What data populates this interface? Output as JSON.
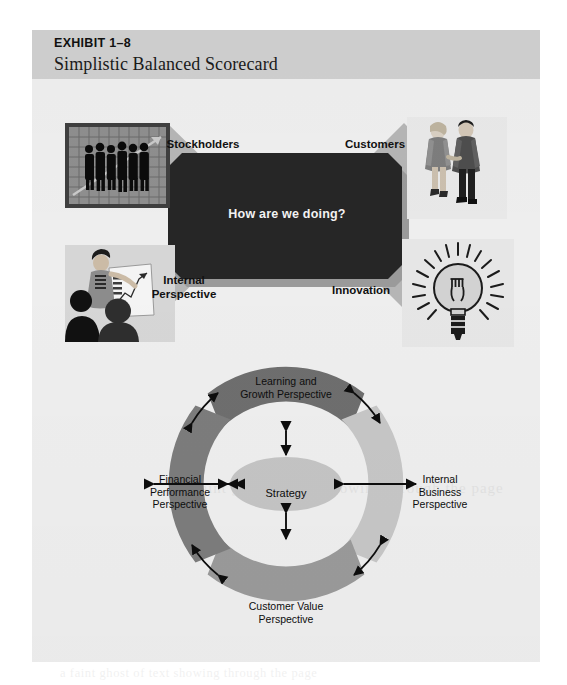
{
  "exhibit": {
    "number": "EXHIBIT 1–8",
    "title": "Simplistic Balanced Scorecard"
  },
  "top_diagram": {
    "center_text": "How are we doing?",
    "labels": {
      "stockholders": "Stockholders",
      "customers": "Customers",
      "internal": "Internal\nPerspective",
      "innovation": "Innovation"
    },
    "photos": {
      "stockholders": "business-people-chart-photo",
      "customers": "couple-walking-photo",
      "internal": "presentation-meeting-photo",
      "innovation": "lightbulb-illustration"
    }
  },
  "circle_diagram": {
    "center": "Strategy",
    "arcs": [
      {
        "id": "learning",
        "label": "Learning and\nGrowth Perspective",
        "position": "top",
        "color": "#6e6e6e"
      },
      {
        "id": "internal",
        "label": "Internal\nBusiness\nPerspective",
        "position": "right",
        "color": "#c6c6c6"
      },
      {
        "id": "customer",
        "label": "Customer Value\nPerspective",
        "position": "bottom",
        "color": "#9a9a9a"
      },
      {
        "id": "financial",
        "label": "Financial\nPerformance\nPerspective",
        "position": "left",
        "color": "#7c7c7c"
      }
    ]
  },
  "colors": {
    "panel_background": "#eeeeee",
    "header_band": "#cfcfcf",
    "center_box": "#262626",
    "arrow_block": "#b3b3b3",
    "strategy_ellipse": "#c4c4c4",
    "stroke": "#141414"
  },
  "bleed_through": {
    "line_1": "a faint ghost of text showing through the page"
  }
}
